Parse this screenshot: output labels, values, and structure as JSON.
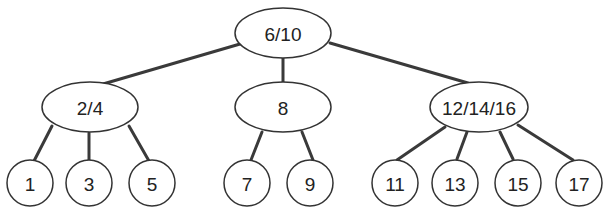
{
  "tree": {
    "root": {
      "label": "6/10"
    },
    "internal": [
      {
        "label": "2/4"
      },
      {
        "label": "8"
      },
      {
        "label": "12/14/16"
      }
    ],
    "leaves": [
      {
        "label": "1"
      },
      {
        "label": "3"
      },
      {
        "label": "5"
      },
      {
        "label": "7"
      },
      {
        "label": "9"
      },
      {
        "label": "11"
      },
      {
        "label": "13"
      },
      {
        "label": "15"
      },
      {
        "label": "17"
      }
    ]
  }
}
